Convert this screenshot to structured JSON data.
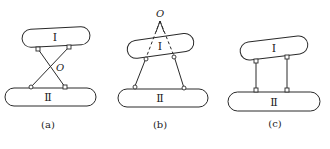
{
  "figure": {
    "panels": [
      {
        "id": "a",
        "caption": "(a)",
        "upper_body_label": "Ⅰ",
        "lower_body_label": "Ⅱ",
        "instant_center_label": "O",
        "linkage": "crossed links",
        "instant_center_position": "between bodies at crossing of links"
      },
      {
        "id": "b",
        "caption": "(b)",
        "upper_body_label": "Ⅰ",
        "lower_body_label": "Ⅱ",
        "instant_center_label": "O",
        "linkage": "converging links, extended with dashed lines",
        "instant_center_position": "above body I at intersection of extended links"
      },
      {
        "id": "c",
        "caption": "(c)",
        "upper_body_label": "Ⅰ",
        "lower_body_label": "Ⅱ",
        "instant_center_label": "",
        "linkage": "parallel links",
        "instant_center_position": "at infinity"
      }
    ],
    "colors": {
      "stroke": "#2a2a2a",
      "background": "#ffffff"
    }
  }
}
